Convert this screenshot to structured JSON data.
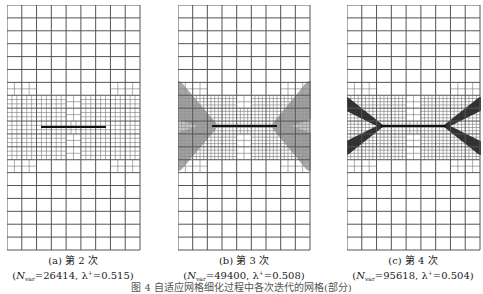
{
  "figure": {
    "caption": "图 4  自适应网格细化过程中各次迭代的网格(部分)",
    "grid": {
      "top": 5,
      "bottom": 250,
      "cols": 9,
      "rows": 19,
      "line_color": "#555555",
      "fine_line_color": "#666666"
    },
    "panels": [
      {
        "id": "a",
        "label": "(a) 第 2 次",
        "n_var_symbol": "N",
        "n_var_sub": "var",
        "n_var": "26414",
        "lambda_symbol": "λ",
        "lambda_sup": "+",
        "lambda": "0.515",
        "x": 7,
        "width": 133,
        "crack": {
          "x1": 41,
          "x2": 106,
          "y": 127
        },
        "refinement_level": 2,
        "band_color": "#ffffff"
      },
      {
        "id": "b",
        "label": "(b) 第 3 次",
        "n_var_symbol": "N",
        "n_var_sub": "var",
        "n_var": "49400",
        "lambda_symbol": "λ",
        "lambda_sup": "+",
        "lambda": "0.508",
        "x": 178,
        "width": 132,
        "crack": {
          "x1": 212,
          "x2": 277,
          "y": 126
        },
        "refinement_level": 3,
        "band_color": "#8a8a8a"
      },
      {
        "id": "c",
        "label": "(c) 第 4 次",
        "n_var_symbol": "N",
        "n_var_sub": "var",
        "n_var": "95618",
        "lambda_symbol": "λ",
        "lambda_sup": "+",
        "lambda": "0.504",
        "x": 347,
        "width": 133,
        "crack": {
          "x1": 381,
          "x2": 446,
          "y": 126
        },
        "refinement_level": 4,
        "band_color": "#2a2a2a"
      }
    ]
  }
}
